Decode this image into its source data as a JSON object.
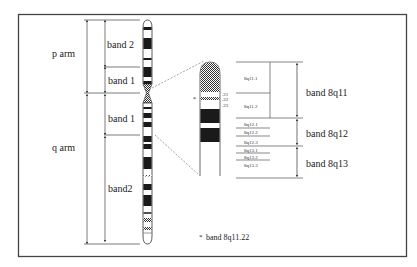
{
  "figure": {
    "type": "chromosome ideogram",
    "chromosome": "8",
    "frame_color": "#444444",
    "band_dark": "#1a1a1a",
    "band_light": "#ffffff",
    "hatch_color": "#555555"
  },
  "left_labels": {
    "p_arm": "p arm",
    "q_arm": "q arm",
    "p_band2": "band 2",
    "p_band1": "band 1",
    "q_band1": "band 1",
    "q_band2": "band2"
  },
  "zoom_markers": {
    "asterisk": "*",
    "sub21": ".21",
    "sub22": ".22",
    "sub23": ".23"
  },
  "sub_bands": [
    {
      "label": "8q11.1"
    },
    {
      "label": "8q11.2"
    },
    {
      "label": "8q12.1"
    },
    {
      "label": "8q12.2"
    },
    {
      "label": "8q12.3"
    },
    {
      "label": "8q13.1"
    },
    {
      "label": "8q13.2"
    },
    {
      "label": "8q13.3"
    }
  ],
  "band_groups": [
    {
      "label": "band 8q11"
    },
    {
      "label": "band 8q12"
    },
    {
      "label": "band 8q13"
    }
  ],
  "footnote": {
    "marker": "*",
    "text": "band 8q11.22"
  }
}
